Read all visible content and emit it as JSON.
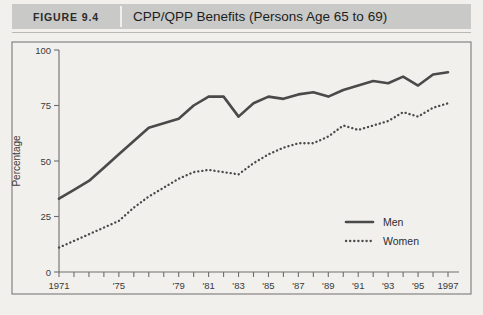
{
  "header": {
    "figure_label": "FIGURE 9.4",
    "title": "CPP/QPP Benefits (Persons Age 65 to 69)"
  },
  "axes": {
    "y_title": "Percentage",
    "y_ticks": [
      "0",
      "25",
      "50",
      "75",
      "100"
    ],
    "x_ticks": [
      "1971",
      "'75",
      "'79",
      "'81",
      "'83",
      "'85",
      "'87",
      "'89",
      "'91",
      "'93",
      "'95",
      "1997"
    ]
  },
  "legend": {
    "men_label": "Men",
    "women_label": "Women"
  },
  "colors": {
    "page_background": "#f1f0ed",
    "header_band": "#c9c9c7",
    "line": "#4a4a4a",
    "axis": "#6e6e6e"
  },
  "chart_data": {
    "type": "line",
    "title": "CPP/QPP Benefits (Persons Age 65 to 69)",
    "xlabel": "",
    "ylabel": "Percentage",
    "ylim": [
      0,
      100
    ],
    "xlim": [
      1971,
      1997
    ],
    "grid": false,
    "legend_position": "inside-lower-right",
    "x": [
      1971,
      1972,
      1973,
      1974,
      1975,
      1976,
      1977,
      1978,
      1979,
      1980,
      1981,
      1982,
      1983,
      1984,
      1985,
      1986,
      1987,
      1988,
      1989,
      1990,
      1991,
      1992,
      1993,
      1994,
      1995,
      1996,
      1997
    ],
    "series": [
      {
        "name": "Men",
        "style": "solid",
        "values": [
          33,
          37,
          41,
          47,
          53,
          59,
          65,
          67,
          69,
          75,
          79,
          79,
          70,
          76,
          79,
          78,
          80,
          81,
          79,
          82,
          84,
          86,
          85,
          88,
          84,
          89,
          90
        ]
      },
      {
        "name": "Women",
        "style": "dotted",
        "values": [
          11,
          14,
          17,
          20,
          23,
          29,
          34,
          38,
          42,
          45,
          46,
          45,
          44,
          49,
          53,
          56,
          58,
          58,
          61,
          66,
          64,
          66,
          68,
          72,
          70,
          74,
          76
        ]
      }
    ]
  }
}
